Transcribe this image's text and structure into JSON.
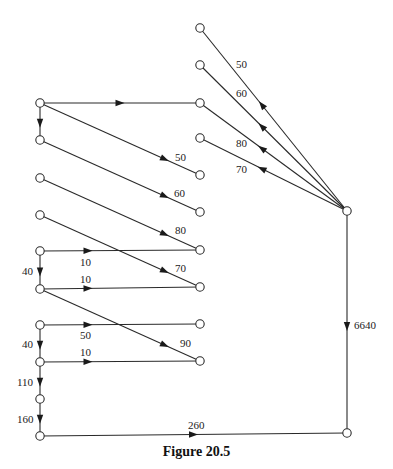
{
  "caption": "Figure 20.5",
  "colors": {
    "stroke": "#2a2a2a",
    "background": "#ffffff"
  },
  "nodes": [
    {
      "id": "R1",
      "x": 200,
      "y": 28
    },
    {
      "id": "R2",
      "x": 200,
      "y": 65
    },
    {
      "id": "R3",
      "x": 200,
      "y": 103
    },
    {
      "id": "R4",
      "x": 200,
      "y": 138
    },
    {
      "id": "R5",
      "x": 200,
      "y": 175
    },
    {
      "id": "R6",
      "x": 200,
      "y": 212
    },
    {
      "id": "R7",
      "x": 200,
      "y": 250
    },
    {
      "id": "R8",
      "x": 200,
      "y": 287
    },
    {
      "id": "R9",
      "x": 200,
      "y": 324
    },
    {
      "id": "R10",
      "x": 200,
      "y": 361
    },
    {
      "id": "L1",
      "x": 40,
      "y": 103
    },
    {
      "id": "L2",
      "x": 40,
      "y": 140
    },
    {
      "id": "L3",
      "x": 40,
      "y": 178
    },
    {
      "id": "L4",
      "x": 40,
      "y": 215
    },
    {
      "id": "L5",
      "x": 40,
      "y": 251
    },
    {
      "id": "L6",
      "x": 40,
      "y": 289
    },
    {
      "id": "L7",
      "x": 40,
      "y": 325
    },
    {
      "id": "L8",
      "x": 40,
      "y": 362
    },
    {
      "id": "L9",
      "x": 40,
      "y": 399
    },
    {
      "id": "L10",
      "x": 40,
      "y": 436
    },
    {
      "id": "S",
      "x": 347,
      "y": 211
    },
    {
      "id": "T",
      "x": 347,
      "y": 433
    }
  ],
  "edges": [
    {
      "from": "L1",
      "to": "R3",
      "label": "",
      "lx": 0,
      "ly": 0,
      "arrow_t": 0.5
    },
    {
      "from": "L1",
      "to": "L2",
      "label": "",
      "lx": 0,
      "ly": 0,
      "arrow_t": 0.55
    },
    {
      "from": "L1",
      "to": "R5",
      "label": "50",
      "lx": 175,
      "ly": 161,
      "arrow_t": 0.78
    },
    {
      "from": "L2",
      "to": "R6",
      "label": "60",
      "lx": 174,
      "ly": 197,
      "arrow_t": 0.78
    },
    {
      "from": "L3",
      "to": "R7",
      "label": "80",
      "lx": 175,
      "ly": 234,
      "arrow_t": 0.78
    },
    {
      "from": "L4",
      "to": "R8",
      "label": "70",
      "lx": 175,
      "ly": 272,
      "arrow_t": 0.78
    },
    {
      "from": "L5",
      "to": "R7",
      "label": "10",
      "lx": 80,
      "ly": 266,
      "arrow_t": 0.3
    },
    {
      "from": "L5",
      "to": "L6",
      "label": "40",
      "lx": 22,
      "ly": 275,
      "arrow_t": 0.55
    },
    {
      "from": "L6",
      "to": "R8",
      "label": "10",
      "lx": 80,
      "ly": 283,
      "arrow_t": 0.3
    },
    {
      "from": "L6",
      "to": "R10",
      "label": "90",
      "lx": 180,
      "ly": 347,
      "arrow_t": 0.78
    },
    {
      "from": "L7",
      "to": "R9",
      "label": "50",
      "lx": 80,
      "ly": 339,
      "arrow_t": 0.3
    },
    {
      "from": "L7",
      "to": "L8",
      "label": "40",
      "lx": 22,
      "ly": 348,
      "arrow_t": 0.55
    },
    {
      "from": "L8",
      "to": "R10",
      "label": "10",
      "lx": 80,
      "ly": 356,
      "arrow_t": 0.3
    },
    {
      "from": "L8",
      "to": "L9",
      "label": "110",
      "lx": 17,
      "ly": 386,
      "arrow_t": 0.55
    },
    {
      "from": "L9",
      "to": "L10",
      "label": "160",
      "lx": 17,
      "ly": 423,
      "arrow_t": 0.55
    },
    {
      "from": "L10",
      "to": "T",
      "label": "260",
      "lx": 188,
      "ly": 429,
      "arrow_t": 0.5
    },
    {
      "from": "S",
      "to": "R1",
      "label": "50",
      "lx": 236,
      "ly": 68,
      "arrow_t": 0.58
    },
    {
      "from": "S",
      "to": "R2",
      "label": "60",
      "lx": 236,
      "ly": 97,
      "arrow_t": 0.58
    },
    {
      "from": "S",
      "to": "R3",
      "label": "80",
      "lx": 236,
      "ly": 147,
      "arrow_t": 0.58
    },
    {
      "from": "S",
      "to": "R4",
      "label": "70",
      "lx": 236,
      "ly": 173,
      "arrow_t": 0.58
    },
    {
      "from": "S",
      "to": "T",
      "label": "6640",
      "lx": 354,
      "ly": 329,
      "arrow_t": 0.52
    }
  ]
}
